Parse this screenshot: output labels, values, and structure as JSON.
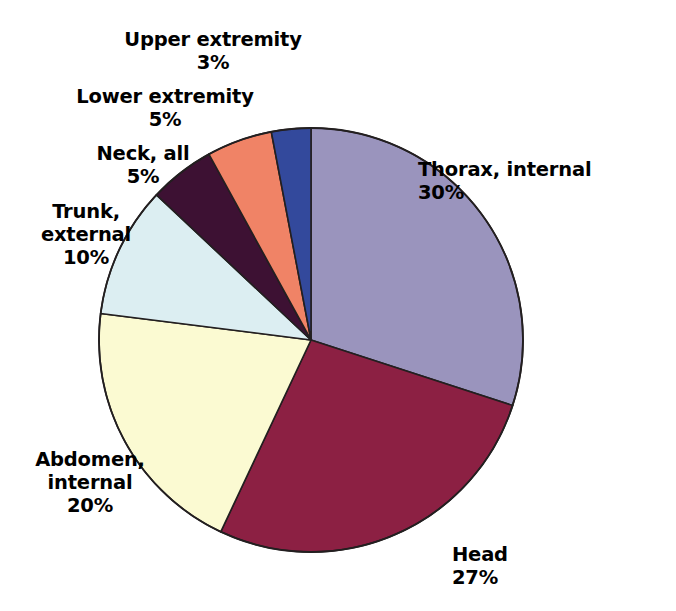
{
  "figure": {
    "background_color": "#ffffff",
    "outline_color": "#231f20",
    "geometry": {
      "center_x": 311,
      "center_y": 340,
      "radius": 212,
      "start_angle_deg": 0,
      "direction": "clockwise"
    }
  },
  "chart_data": {
    "type": "pie",
    "title": "",
    "subtitle": "",
    "xlabel": "",
    "ylabel": "",
    "grid": false,
    "legend_position": "none",
    "labels_outside": true,
    "value_unit": "%",
    "total": 100,
    "categories": [
      "Thorax, internal",
      "Head",
      "Abdomen, internal",
      "Trunk, external",
      "Neck, all",
      "Lower extremity",
      "Upper extremity"
    ],
    "values": [
      30,
      27,
      20,
      10,
      5,
      5,
      3
    ],
    "colors": [
      "#9a94bd",
      "#8c2043",
      "#fbfad2",
      "#dceef2",
      "#3d1133",
      "#f08366",
      "#33499c"
    ],
    "slices": [
      {
        "name": "Thorax, internal",
        "value": 30,
        "value_label": "30%",
        "color": "#9a94bd",
        "label_line1": "Thorax, internal",
        "label_line2": "30%",
        "label_align": "left"
      },
      {
        "name": "Head",
        "value": 27,
        "value_label": "27%",
        "color": "#8c2043",
        "label_line1": "Head",
        "label_line2": "27%",
        "label_align": "left"
      },
      {
        "name": "Abdomen, internal",
        "value": 20,
        "value_label": "20%",
        "color": "#fbfad2",
        "label_line1": "Abdomen,",
        "label_line2": "internal",
        "label_line3": "20%",
        "label_align": "center"
      },
      {
        "name": "Trunk, external",
        "value": 10,
        "value_label": "10%",
        "color": "#dceef2",
        "label_line1": "Trunk,",
        "label_line2": "external",
        "label_line3": "10%",
        "label_align": "center"
      },
      {
        "name": "Neck, all",
        "value": 5,
        "value_label": "5%",
        "color": "#3d1133",
        "label_line1": "Neck, all",
        "label_line2": "5%",
        "label_align": "center"
      },
      {
        "name": "Lower extremity",
        "value": 5,
        "value_label": "5%",
        "color": "#f08366",
        "label_line1": "Lower extremity",
        "label_line2": "5%",
        "label_align": "center"
      },
      {
        "name": "Upper extremity",
        "value": 3,
        "value_label": "3%",
        "color": "#33499c",
        "label_line1": "Upper extremity",
        "label_line2": "3%",
        "label_align": "center"
      }
    ]
  },
  "labels": {
    "upper_extremity": "Upper extremity\n3%",
    "lower_extremity": "Lower extremity\n5%",
    "neck_all": "Neck, all\n5%",
    "trunk_external": "Trunk,\nexternal\n10%",
    "abdomen_internal": "Abdomen,\ninternal\n20%",
    "head": "Head\n27%",
    "thorax_internal": "Thorax, internal\n30%"
  }
}
